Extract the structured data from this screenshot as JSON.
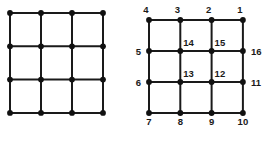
{
  "figure": {
    "title": "",
    "background_color": "#ffffff",
    "line_color": "#1a1a1a",
    "dot_color": "#111111",
    "label_color": "#1a1a1a"
  },
  "chart_data": {
    "type": "diagram",
    "title": "",
    "grids": [
      {
        "name": "unlabeled-grid",
        "rows": 4,
        "cols": 4,
        "origin_x": 10,
        "origin_y": 13,
        "step_x": 31,
        "step_y": 33.3,
        "labeled": false,
        "labels": []
      },
      {
        "name": "labeled-grid",
        "rows": 4,
        "cols": 4,
        "origin_x": 149,
        "origin_y": 20,
        "step_x": 31.3,
        "step_y": 31,
        "labeled": true,
        "labels": [
          {
            "text": "4",
            "row": 0,
            "col": 0,
            "anchor": "above-left"
          },
          {
            "text": "3",
            "row": 0,
            "col": 1,
            "anchor": "above-left"
          },
          {
            "text": "2",
            "row": 0,
            "col": 2,
            "anchor": "above-left"
          },
          {
            "text": "1",
            "row": 0,
            "col": 3,
            "anchor": "above-left"
          },
          {
            "text": "5",
            "row": 1,
            "col": 0,
            "anchor": "left"
          },
          {
            "text": "14",
            "row": 1,
            "col": 1,
            "anchor": "above-right"
          },
          {
            "text": "15",
            "row": 1,
            "col": 2,
            "anchor": "above-right"
          },
          {
            "text": "16",
            "row": 1,
            "col": 3,
            "anchor": "right"
          },
          {
            "text": "6",
            "row": 2,
            "col": 0,
            "anchor": "left"
          },
          {
            "text": "13",
            "row": 2,
            "col": 1,
            "anchor": "above-right"
          },
          {
            "text": "12",
            "row": 2,
            "col": 2,
            "anchor": "above-right"
          },
          {
            "text": "11",
            "row": 2,
            "col": 3,
            "anchor": "right"
          },
          {
            "text": "7",
            "row": 3,
            "col": 0,
            "anchor": "below"
          },
          {
            "text": "8",
            "row": 3,
            "col": 1,
            "anchor": "below"
          },
          {
            "text": "9",
            "row": 3,
            "col": 2,
            "anchor": "below"
          },
          {
            "text": "10",
            "row": 3,
            "col": 3,
            "anchor": "below"
          }
        ]
      }
    ]
  }
}
